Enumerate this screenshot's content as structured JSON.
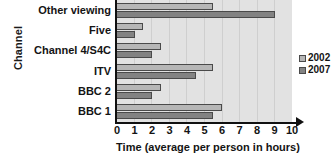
{
  "chart_data": {
    "type": "bar",
    "orientation": "horizontal",
    "title": "",
    "xlabel": "Time (average per person in hours)",
    "ylabel": "Channel",
    "categories": [
      "Other viewing",
      "Five",
      "Channel 4/S4C",
      "ITV",
      "BBC 2",
      "BBC 1"
    ],
    "series": [
      {
        "name": "2002",
        "color": "#b6b6b6",
        "values": [
          5.5,
          1.5,
          2.5,
          5.5,
          2.5,
          6.0
        ]
      },
      {
        "name": "2007",
        "color": "#838383",
        "values": [
          9.0,
          1.0,
          2.0,
          4.5,
          2.0,
          5.5
        ]
      }
    ],
    "xlim": [
      0,
      10
    ],
    "xticks": [
      0,
      1,
      2,
      3,
      4,
      5,
      6,
      7,
      8,
      9,
      10
    ],
    "xtick_labels": [
      "0",
      "1",
      "2",
      "3",
      "4",
      "5",
      "6",
      "7",
      "8",
      "9",
      "10"
    ],
    "grid": true,
    "grid_axis": "x",
    "legend_position": "right",
    "plot_background": "#e2e2e2",
    "bar_border_color": "#4a4a4a",
    "axis_color": "#111111"
  },
  "legend": {
    "items": [
      {
        "label": "2002"
      },
      {
        "label": "2007"
      }
    ]
  }
}
